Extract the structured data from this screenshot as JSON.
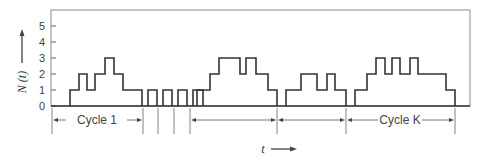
{
  "figure": {
    "y_axis_label": "N (t)",
    "x_axis_label": "t",
    "y_ticks": [
      "0",
      "1",
      "2",
      "3",
      "4",
      "5"
    ],
    "cycle_labels": [
      "Cycle 1",
      "Cycle K"
    ]
  },
  "chart_data": {
    "type": "step",
    "title": "",
    "xlabel": "t",
    "ylabel": "N(t)",
    "ylim": [
      0,
      5
    ],
    "yticks": [
      0,
      1,
      2,
      3,
      4,
      5
    ],
    "x_pixel_range": [
      51,
      470
    ],
    "segments": [
      {
        "name": "Cycle 1",
        "steps": [
          [
            70,
            1
          ],
          [
            79,
            2
          ],
          [
            87,
            1
          ],
          [
            95,
            2
          ],
          [
            105,
            3
          ],
          [
            114,
            2
          ],
          [
            123,
            1
          ],
          [
            142,
            0
          ]
        ]
      },
      {
        "name": "pulse 1",
        "steps": [
          [
            148,
            1
          ],
          [
            157,
            0
          ]
        ]
      },
      {
        "name": "pulse 2",
        "steps": [
          [
            163,
            1
          ],
          [
            172,
            0
          ]
        ]
      },
      {
        "name": "pulse 3",
        "steps": [
          [
            178,
            1
          ],
          [
            187,
            0
          ]
        ]
      },
      {
        "name": "pulse 4",
        "steps": [
          [
            193,
            1
          ],
          [
            203,
            0
          ]
        ]
      },
      {
        "name": "busy period 3",
        "steps": [
          [
            197,
            1
          ],
          [
            210,
            2
          ],
          [
            219,
            3
          ],
          [
            240,
            2
          ],
          [
            246,
            3
          ],
          [
            256,
            2
          ],
          [
            268,
            1
          ],
          [
            277,
            0
          ]
        ]
      },
      {
        "name": "busy period 4",
        "steps": [
          [
            286,
            1
          ],
          [
            301,
            2
          ],
          [
            317,
            1
          ],
          [
            327,
            2
          ],
          [
            335,
            1
          ],
          [
            346,
            0
          ]
        ]
      },
      {
        "name": "Cycle K",
        "steps": [
          [
            355,
            1
          ],
          [
            367,
            2
          ],
          [
            376,
            3
          ],
          [
            385,
            2
          ],
          [
            392,
            3
          ],
          [
            400,
            2
          ],
          [
            410,
            3
          ],
          [
            418,
            2
          ],
          [
            446,
            1
          ],
          [
            455,
            0
          ]
        ]
      }
    ],
    "cycle_boundaries": [
      52,
      143,
      158,
      174,
      190,
      277,
      346,
      455
    ],
    "annotations": [
      "Cycle 1",
      "Cycle K",
      "t →",
      "N(t) ↑"
    ]
  }
}
